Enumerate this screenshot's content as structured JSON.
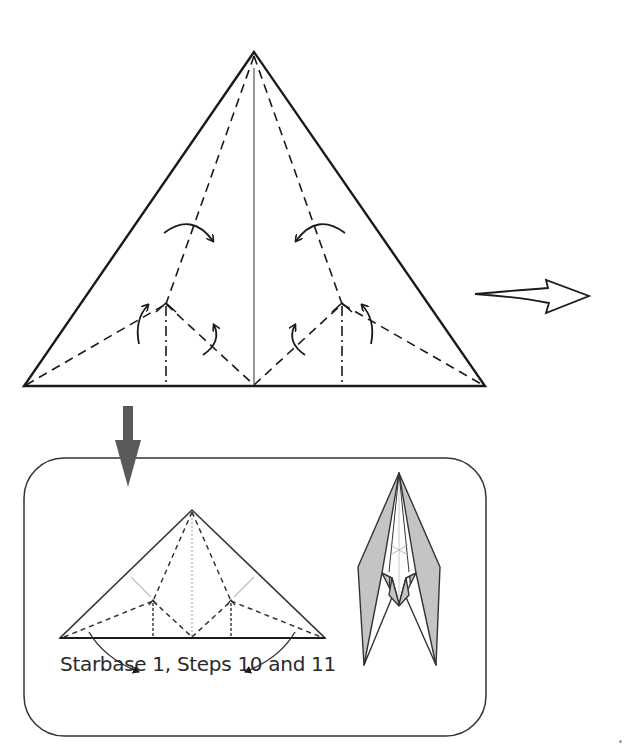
{
  "diagram": {
    "type": "origami-folding-diagram",
    "main_step": {
      "shape": "triangle",
      "lines": [
        "outer-edge",
        "center-crease",
        "valley-fold-dashed",
        "mountain-fold-dash-dot"
      ],
      "arrows": [
        "fold-arrow-left",
        "fold-arrow-right",
        "small-fold-arrows"
      ]
    },
    "next_arrow": "hollow-right-arrow",
    "reference_arrow": "solid-down-arrow",
    "inset": {
      "caption": "Starbase 1, Steps 10 and 11",
      "result_model": "folded-starship-model"
    },
    "colors": {
      "line": "#1a1a1a",
      "down_arrow": "#5a5a5a",
      "shade": "#c8c8c8",
      "light_crease": "#bbbbbb"
    }
  }
}
